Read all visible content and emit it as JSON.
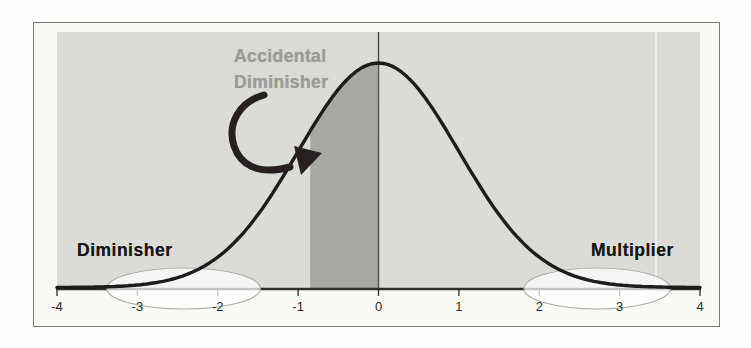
{
  "annotations": {
    "accidental": {
      "line1": "Accidental",
      "line2": "Diminisher"
    },
    "diminisher": "Diminisher",
    "multiplier": "Multiplier"
  },
  "chart_data": {
    "type": "area",
    "title": "",
    "curve": {
      "distribution": "normal",
      "mean": 0,
      "sigma": 1
    },
    "xlim": [
      -4,
      4
    ],
    "x_tick_values": [
      -4,
      -3,
      -2,
      -1,
      0,
      1,
      2,
      3,
      4
    ],
    "x_tick_labels": [
      "-4",
      "-3",
      "-2",
      "-1",
      "0",
      "1",
      "2",
      "3",
      "4"
    ],
    "grid": false,
    "legend": false,
    "vertical_reference_line_x": 0,
    "shaded_region": {
      "from": -0.85,
      "to": 0,
      "label": "Accidental Diminisher"
    },
    "tail_ellipses": [
      {
        "label": "Diminisher",
        "from": -3.38,
        "to": -1.47
      },
      {
        "label": "Multiplier",
        "from": 1.81,
        "to": 3.63
      }
    ],
    "annotation_texts": [
      {
        "text": "Accidental Diminisher",
        "target": "shaded region between -0.85 and 0",
        "style": "gray, with curved arrow"
      },
      {
        "text": "Diminisher",
        "target": "left tail"
      },
      {
        "text": "Multiplier",
        "target": "right tail"
      }
    ],
    "colors": {
      "plot_bg": "#dbdbd8",
      "shade": "#a8a8a5",
      "curve": "#1d1d1d",
      "axis": "#2e2e2e",
      "tick_text": "#2b2b2b",
      "gray_text": "#9b9b99",
      "black_text": "#171717",
      "ellipse_stroke": "#acacaa",
      "arrow": "#262020"
    }
  }
}
